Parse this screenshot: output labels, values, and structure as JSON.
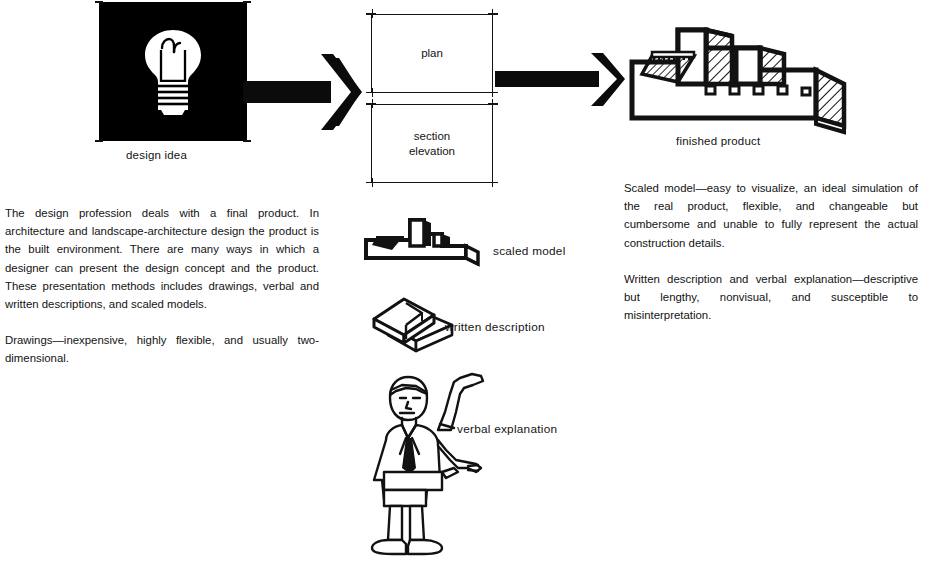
{
  "page": {
    "background_color": "#ffffff",
    "ink_color": "#141414"
  },
  "flow": {
    "step1": {
      "caption": "design idea",
      "icon": "lightbulb-icon",
      "panel_color": "#000000",
      "bulb_color": "#ffffff"
    },
    "arrow1": {
      "icon": "right-arrow-icon"
    },
    "step2": {
      "boxes": [
        {
          "label": "plan",
          "icon": "plan-drawing-box"
        },
        {
          "label": "section\nelevation",
          "label_line1": "section",
          "label_line2": "elevation",
          "icon": "section-elevation-drawing-box"
        }
      ]
    },
    "arrow2": {
      "icon": "right-arrow-icon"
    },
    "step3": {
      "caption": "finished product",
      "icon": "factory-building-axonometric-icon"
    }
  },
  "methods": [
    {
      "label": "scaled model",
      "icon": "scaled-model-icon"
    },
    {
      "label": "written description",
      "icon": "books-icon"
    },
    {
      "label": "verbal explanation",
      "icon": "speaking-person-icon"
    }
  ],
  "text": {
    "left_column": [
      "The design profession deals with a final product. In architecture and landscape-architecture design the product is the built environment. There are many ways in which a designer can present the design concept and the product. These presentation methods includes drawings, verbal and written descriptions, and scaled models.",
      "Drawings—inexpensive, highly flexible, and usually two-dimensional."
    ],
    "right_column": [
      "Scaled model—easy to visualize, an ideal simulation of the real product, flexible, and changeable but cumbersome and unable to fully represent the actual construction details.",
      "Written description and verbal explanation—descriptive but lengthy, nonvisual, and susceptible to misinterpretation."
    ]
  }
}
